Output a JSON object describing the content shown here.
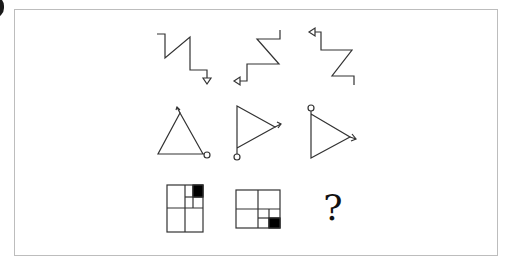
{
  "puzzle": {
    "type": "figure-reasoning-3x3",
    "rows": [
      {
        "name": "row-1",
        "figures": [
          "zigzag-with-down-arrow",
          "zigzag-with-left-arrow",
          "zigzag-with-left-arrow-top"
        ]
      },
      {
        "name": "row-2",
        "figures": [
          "triangle-up-arrow-circle",
          "triangle-right-arrow-circle-bottom",
          "triangle-right-arrow-circle-top"
        ]
      },
      {
        "name": "row-3",
        "figures": [
          "grid-black-square-top-right",
          "grid-black-square-bottom-right",
          "unknown"
        ]
      }
    ],
    "answer_placeholder": "?"
  },
  "colors": {
    "line": "#333333",
    "fill": "#000000",
    "frame": "#bdbdbd",
    "background": "#ffffff"
  }
}
